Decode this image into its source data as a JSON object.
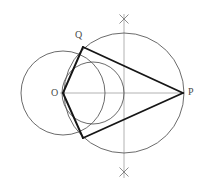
{
  "figure": {
    "type": "geometric-construction",
    "background_color": "#ffffff",
    "stroke_color_thin": "#555555",
    "stroke_color_light": "#9a9a9a",
    "stroke_color_bold": "#1a1a1a",
    "label_color": "#4a4a4a",
    "canvas": {
      "width": 206,
      "height": 186
    }
  },
  "labels": {
    "center": "O",
    "tangent_point": "Q",
    "external_point": "P"
  },
  "points": {
    "O": {
      "x": 63,
      "y": 93
    },
    "P": {
      "x": 183,
      "y": 93
    },
    "Q": {
      "x": 83,
      "y": 47
    },
    "Q_lower": {
      "x": 83,
      "y": 138
    },
    "midpoint": {
      "x": 123,
      "y": 93
    },
    "arc_cross_top": {
      "x": 124,
      "y": 19
    },
    "arc_cross_bottom": {
      "x": 124,
      "y": 172
    }
  },
  "circles": [
    {
      "name": "base-circle",
      "cx": 63,
      "cy": 93,
      "r": 42,
      "style": "thin"
    },
    {
      "name": "thales-circle",
      "cx": 93,
      "cy": 93,
      "r": 31,
      "style": "thin"
    },
    {
      "name": "construction-circle",
      "cx": 124,
      "cy": 93,
      "r": 60,
      "style": "thin"
    }
  ],
  "lines": [
    {
      "name": "axis-horizontal",
      "x1": 60,
      "y1": 93,
      "x2": 184,
      "y2": 93,
      "style": "light"
    },
    {
      "name": "axis-vertical",
      "x1": 124,
      "y1": 14,
      "x2": 124,
      "y2": 178,
      "style": "light"
    },
    {
      "name": "radius-OQ",
      "x1": 63,
      "y1": 93,
      "x2": 83,
      "y2": 47,
      "style": "bold"
    },
    {
      "name": "radius-OQ-lower",
      "x1": 63,
      "y1": 93,
      "x2": 83,
      "y2": 138,
      "style": "bold"
    },
    {
      "name": "tangent-QP",
      "x1": 83,
      "y1": 47,
      "x2": 183,
      "y2": 93,
      "style": "bold"
    },
    {
      "name": "tangent-QP-lower",
      "x1": 83,
      "y1": 138,
      "x2": 183,
      "y2": 93,
      "style": "bold"
    }
  ],
  "cross_marks": [
    {
      "name": "cross-top",
      "cx": 124,
      "cy": 19,
      "size": 6
    },
    {
      "name": "cross-bottom",
      "cx": 124,
      "cy": 172,
      "size": 6
    }
  ]
}
